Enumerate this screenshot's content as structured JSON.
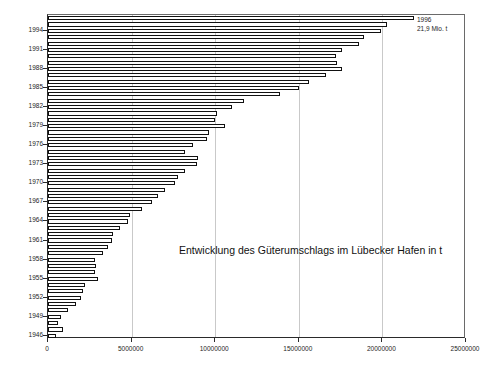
{
  "chart_data": {
    "type": "bar",
    "orientation": "horizontal",
    "title": "Entwicklung des Güterumschlags im Lübecker Hafen in t",
    "xlabel": "",
    "ylabel": "",
    "xlim": [
      0,
      25000000
    ],
    "grid": true,
    "legend": null,
    "xticks": [
      "0",
      "5000000",
      "10000000",
      "15000000",
      "20000000",
      "25000000"
    ],
    "xtick_values": [
      0,
      5000000,
      10000000,
      15000000,
      20000000,
      25000000
    ],
    "ytick_labels": [
      "1994",
      "1991",
      "1988",
      "1985",
      "1982",
      "1979",
      "1976",
      "1973",
      "1970",
      "1967",
      "1964",
      "1961",
      "1958",
      "1955",
      "1952",
      "1949",
      "1946"
    ],
    "annotations": [
      {
        "name": "peak-1996",
        "line1": "1996",
        "line2": "21,9 Mio. t",
        "value": 21900000
      }
    ],
    "categories": [
      "1996",
      "1995",
      "1994",
      "1993",
      "1992",
      "1991",
      "1990",
      "1989",
      "1988",
      "1987",
      "1986",
      "1985",
      "1984",
      "1983",
      "1982",
      "1981",
      "1980",
      "1979",
      "1978",
      "1977",
      "1976",
      "1975",
      "1974",
      "1973",
      "1972",
      "1971",
      "1970",
      "1969",
      "1968",
      "1967",
      "1966",
      "1965",
      "1964",
      "1963",
      "1962",
      "1961",
      "1960",
      "1959",
      "1958",
      "1957",
      "1956",
      "1955",
      "1954",
      "1953",
      "1952",
      "1951",
      "1950",
      "1949",
      "1948",
      "1947",
      "1946"
    ],
    "values": [
      21900000,
      20300000,
      19900000,
      18900000,
      18600000,
      17600000,
      17200000,
      17300000,
      17600000,
      16600000,
      15600000,
      15000000,
      13900000,
      11700000,
      11000000,
      10100000,
      10000000,
      10600000,
      9600000,
      9500000,
      8700000,
      8200000,
      9000000,
      8900000,
      8200000,
      7800000,
      7600000,
      7000000,
      6600000,
      6200000,
      5600000,
      4900000,
      4800000,
      4300000,
      3900000,
      3800000,
      3600000,
      3300000,
      2800000,
      2900000,
      2800000,
      3000000,
      2200000,
      2100000,
      2000000,
      1700000,
      1200000,
      800000,
      600000,
      900000,
      500000
    ]
  },
  "axes": {
    "x_axis_name": "cargo-turnover-tonnes",
    "y_axis_name": "year"
  }
}
